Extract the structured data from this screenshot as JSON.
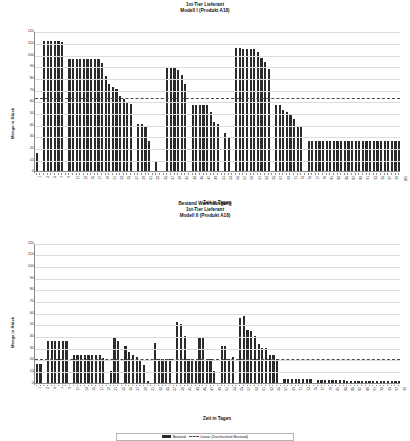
{
  "document": {
    "background_color": "#ffffff",
    "bar_color": "#2b2b2b",
    "trend_color": "#4a4a4a",
    "axis_color": "#8a8a8a"
  },
  "chart_data": [
    {
      "type": "bar",
      "id": "chart-modell-1",
      "title": "1st-Tier Lieferant",
      "subtitle": "Modell I (Produkt A18)",
      "title_lines": [
        "1st-Tier Lieferant",
        "Modell I (Produkt A18)"
      ],
      "xlabel": "Zeit in Tagen",
      "ylabel": "Menge in Stück",
      "ylim": [
        0,
        120
      ],
      "ytick_step": 10,
      "yticks": [
        0,
        10,
        20,
        30,
        40,
        50,
        60,
        70,
        80,
        90,
        100,
        110,
        120
      ],
      "grid": true,
      "legend": false,
      "xtick_labels_shown": [
        "1",
        "3",
        "5",
        "7",
        "9",
        "11",
        "13",
        "15",
        "17",
        "19",
        "21",
        "23",
        "25",
        "27",
        "29",
        "31",
        "33",
        "35",
        "37",
        "39",
        "41",
        "43",
        "45",
        "47",
        "49",
        "51",
        "53",
        "55",
        "57",
        "59",
        "61",
        "63",
        "65",
        "67",
        "69",
        "71",
        "73",
        "75",
        "77",
        "79",
        "81",
        "83",
        "85",
        "87",
        "89",
        "91",
        "93",
        "95",
        "97",
        "99",
        "101"
      ],
      "x": [
        1,
        2,
        3,
        4,
        5,
        6,
        7,
        8,
        9,
        10,
        11,
        12,
        13,
        14,
        15,
        16,
        17,
        18,
        19,
        20,
        21,
        22,
        23,
        24,
        25,
        26,
        27,
        28,
        29,
        30,
        31,
        32,
        33,
        34,
        35,
        36,
        37,
        38,
        39,
        40,
        41,
        42,
        43,
        44,
        45,
        46,
        47,
        48,
        49,
        50,
        51,
        52,
        53,
        54,
        55,
        56,
        57,
        58,
        59,
        60,
        61,
        62,
        63,
        64,
        65,
        66,
        67,
        68,
        69,
        70,
        71,
        72,
        73,
        74,
        75,
        76,
        77,
        78,
        79,
        80,
        81,
        82,
        83,
        84,
        85,
        86,
        87,
        88,
        89,
        90,
        91,
        92,
        93,
        94,
        95,
        96,
        97,
        98,
        99,
        100,
        101
      ],
      "series": [
        {
          "name": "Bestand",
          "values": [
            16,
            0,
            112,
            112,
            112,
            112,
            112,
            111,
            0,
            96,
            96,
            96,
            96,
            96,
            96,
            96,
            96,
            96,
            93,
            82,
            75,
            72,
            71,
            65,
            62,
            59,
            58,
            0,
            41,
            41,
            38,
            26,
            0,
            9,
            0,
            0,
            89,
            89,
            89,
            87,
            83,
            75,
            0,
            57,
            57,
            57,
            57,
            57,
            51,
            42,
            41,
            0,
            33,
            29,
            0,
            106,
            106,
            105,
            105,
            105,
            105,
            102,
            97,
            94,
            88,
            0,
            57,
            57,
            53,
            51,
            49,
            45,
            38,
            38,
            0,
            26,
            26,
            26,
            26,
            26,
            26,
            26,
            26,
            26,
            26,
            26,
            26,
            26,
            26,
            26,
            26,
            26,
            26,
            26,
            26,
            26,
            26,
            26,
            26,
            26,
            26
          ]
        }
      ],
      "trendline": {
        "name": "Linear (Durchschnitt Bestand)",
        "value": 64,
        "style": "dashed"
      }
    },
    {
      "type": "bar",
      "id": "chart-modell-2",
      "title": "Bestand Warenausgang",
      "subtitle": "1st-Tier Lieferant",
      "subtitle2": "Modell II (Produkt A18)",
      "title_lines": [
        "Bestand Warenausgang",
        "1st-Tier Lieferant",
        "Modell II (Produkt A18)"
      ],
      "xlabel": "Zeit in Tagen",
      "ylabel": "Menge in Stück",
      "ylim": [
        0,
        120
      ],
      "ytick_step": 10,
      "yticks": [
        0,
        10,
        20,
        30,
        40,
        50,
        60,
        70,
        80,
        90,
        100,
        110,
        120
      ],
      "grid": true,
      "legend": true,
      "xtick_labels_shown": [
        "1",
        "3",
        "5",
        "7",
        "9",
        "11",
        "13",
        "15",
        "17",
        "19",
        "21",
        "23",
        "25",
        "27",
        "29",
        "31",
        "33",
        "35",
        "37",
        "39",
        "41",
        "43",
        "45",
        "47",
        "49",
        "51",
        "53",
        "55",
        "57",
        "59",
        "61",
        "63",
        "65",
        "67",
        "69",
        "71",
        "73",
        "75",
        "77",
        "79",
        "81",
        "83",
        "85",
        "87",
        "89",
        "91",
        "93",
        "95",
        "97",
        "99"
      ],
      "x": [
        1,
        2,
        3,
        4,
        5,
        6,
        7,
        8,
        9,
        10,
        11,
        12,
        13,
        14,
        15,
        16,
        17,
        18,
        19,
        20,
        21,
        22,
        23,
        24,
        25,
        26,
        27,
        28,
        29,
        30,
        31,
        32,
        33,
        34,
        35,
        36,
        37,
        38,
        39,
        40,
        41,
        42,
        43,
        44,
        45,
        46,
        47,
        48,
        49,
        50,
        51,
        52,
        53,
        54,
        55,
        56,
        57,
        58,
        59,
        60,
        61,
        62,
        63,
        64,
        65,
        66,
        67,
        68,
        69,
        70,
        71,
        72,
        73,
        74,
        75,
        76,
        77,
        78,
        79,
        80,
        81,
        82,
        83,
        84,
        85,
        86,
        87,
        88,
        89,
        90,
        91,
        92,
        93,
        94,
        95,
        96,
        97,
        98,
        99
      ],
      "series": [
        {
          "name": "Bestand",
          "values": [
            16,
            16,
            0,
            36,
            36,
            36,
            36,
            36,
            36,
            0,
            24,
            24,
            24,
            24,
            24,
            24,
            24,
            24,
            21,
            0,
            10,
            38,
            36,
            0,
            31,
            26,
            24,
            22,
            19,
            15,
            1,
            0,
            34,
            20,
            20,
            20,
            20,
            0,
            52,
            50,
            40,
            20,
            20,
            19,
            38,
            38,
            20,
            20,
            10,
            0,
            31,
            31,
            20,
            22,
            0,
            55,
            57,
            45,
            44,
            40,
            33,
            30,
            30,
            24,
            24,
            20,
            0,
            3,
            3,
            3,
            3,
            3,
            3,
            3,
            3,
            0,
            2,
            2,
            2,
            2,
            2,
            2,
            2,
            2,
            1,
            1,
            1,
            1,
            1,
            1,
            1,
            1,
            1,
            1,
            1,
            1,
            1,
            1,
            1
          ]
        }
      ],
      "trendline": {
        "name": "Linear (Durchschnitt Bestand)",
        "value": 21,
        "style": "dashed"
      },
      "legend_items": [
        {
          "label": "Bestand",
          "marker": "bar-swatch"
        },
        {
          "label": "Linear (Durchschnitt Bestand)",
          "marker": "dashed-line"
        }
      ]
    }
  ]
}
